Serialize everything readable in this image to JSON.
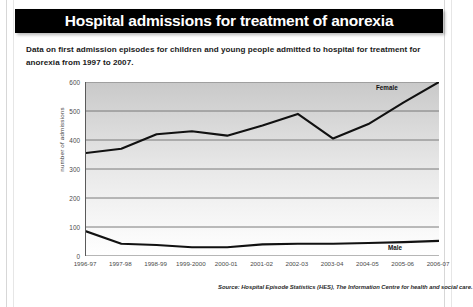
{
  "header": {
    "title": "Hospital admissions for treatment of anorexia"
  },
  "subtitle": "Data on first admission episodes for children and young people admitted to hospital for treatment for anorexia from 1997 to 2007.",
  "source": "Source: Hospital Episode Statistics (HES), The Information Centre for health and social care.",
  "colors": {
    "title_bar_background": "#000000",
    "title_text": "#ffffff",
    "line": "#111111",
    "plot_top": "#c9c9c9",
    "plot_bottom": "#ffffff",
    "gridline": "#6e6e6e"
  },
  "chart_data": {
    "type": "line",
    "title": "Hospital admissions for treatment of anorexia",
    "xlabel": "",
    "ylabel": "number of admissions",
    "categories": [
      "1996-97",
      "1997-98",
      "1998-99",
      "1999-2000",
      "2000-01",
      "2001-02",
      "2002-03",
      "2003-04",
      "2004-05",
      "2005-06",
      "2006-07"
    ],
    "yticks": [
      0,
      100,
      200,
      300,
      400,
      500,
      600
    ],
    "ylim": [
      0,
      600
    ],
    "grid": true,
    "legend": "inline-series-labels",
    "series": [
      {
        "name": "Female",
        "values": [
          355,
          370,
          420,
          430,
          415,
          450,
          490,
          405,
          455,
          530,
          600
        ],
        "label_position": "upper-right"
      },
      {
        "name": "Male",
        "values": [
          85,
          42,
          38,
          30,
          30,
          40,
          42,
          42,
          45,
          48,
          52
        ],
        "label_position": "lower-right"
      }
    ]
  }
}
